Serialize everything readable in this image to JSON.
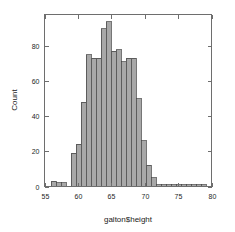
{
  "figure": {
    "background_color": "#ffffff",
    "frame_color": "#6e6e6e",
    "bar_fill": "#a8a8a8",
    "bar_stroke": "#3c3c3c"
  },
  "chart_data": {
    "type": "bar",
    "title": "",
    "subtitle": "",
    "xlabel": "galton$height",
    "ylabel": "Count",
    "xlim": [
      55,
      80
    ],
    "ylim": [
      0,
      98
    ],
    "grid": false,
    "legend": false,
    "bin_width": 0.75,
    "x_ticks": [
      55,
      60,
      65,
      70,
      75,
      80
    ],
    "x_tick_labels": [
      "55",
      "60",
      "65",
      "70",
      "75",
      "80"
    ],
    "y_ticks": [
      0,
      20,
      40,
      60,
      80
    ],
    "y_tick_labels": [
      "0",
      "20",
      "40",
      "60",
      "80"
    ],
    "bins": [
      {
        "x0": 56.0,
        "x1": 56.75,
        "value": 3
      },
      {
        "x0": 56.75,
        "x1": 57.5,
        "value": 2
      },
      {
        "x0": 57.5,
        "x1": 58.25,
        "value": 2
      },
      {
        "x0": 58.25,
        "x1": 59.0,
        "value": 0
      },
      {
        "x0": 59.0,
        "x1": 59.75,
        "value": 19
      },
      {
        "x0": 59.75,
        "x1": 60.5,
        "value": 24
      },
      {
        "x0": 60.5,
        "x1": 61.25,
        "value": 48
      },
      {
        "x0": 61.25,
        "x1": 62.0,
        "value": 75
      },
      {
        "x0": 62.0,
        "x1": 62.75,
        "value": 73
      },
      {
        "x0": 62.75,
        "x1": 63.5,
        "value": 73
      },
      {
        "x0": 63.5,
        "x1": 64.25,
        "value": 90
      },
      {
        "x0": 64.25,
        "x1": 65.0,
        "value": 94
      },
      {
        "x0": 65.0,
        "x1": 65.75,
        "value": 77
      },
      {
        "x0": 65.75,
        "x1": 66.5,
        "value": 78
      },
      {
        "x0": 66.5,
        "x1": 67.25,
        "value": 71
      },
      {
        "x0": 67.25,
        "x1": 68.0,
        "value": 73
      },
      {
        "x0": 68.0,
        "x1": 68.75,
        "value": 73
      },
      {
        "x0": 68.75,
        "x1": 69.5,
        "value": 50
      },
      {
        "x0": 69.5,
        "x1": 70.25,
        "value": 26
      },
      {
        "x0": 70.25,
        "x1": 71.0,
        "value": 12
      },
      {
        "x0": 71.0,
        "x1": 71.75,
        "value": 5
      },
      {
        "x0": 71.75,
        "x1": 72.5,
        "value": 1
      },
      {
        "x0": 72.5,
        "x1": 73.25,
        "value": 1
      },
      {
        "x0": 73.25,
        "x1": 74.0,
        "value": 1
      },
      {
        "x0": 74.0,
        "x1": 74.75,
        "value": 1
      },
      {
        "x0": 74.75,
        "x1": 75.5,
        "value": 1
      },
      {
        "x0": 75.5,
        "x1": 76.25,
        "value": 1
      },
      {
        "x0": 76.25,
        "x1": 77.0,
        "value": 1
      },
      {
        "x0": 77.0,
        "x1": 77.75,
        "value": 1
      },
      {
        "x0": 77.75,
        "x1": 78.5,
        "value": 1
      },
      {
        "x0": 78.5,
        "x1": 79.25,
        "value": 1
      }
    ]
  }
}
